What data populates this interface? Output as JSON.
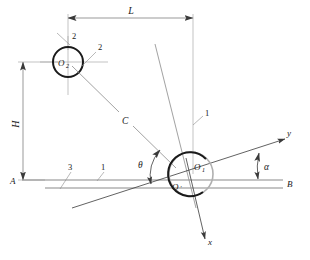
{
  "figure": {
    "type": "engineering-line-diagram",
    "background_color": "#ffffff",
    "line_color": "#6e6e6e",
    "heavy_line_color": "#1a1a1a",
    "text_color": "#1a1a1a"
  },
  "labels": {
    "dimension_L": "L",
    "dimension_H": "H",
    "circle_small_center": "O",
    "circle_small_center_sub": "2",
    "circle_large_center": "O",
    "circle_large_center_sub": "1",
    "point_o_prime": "O",
    "point_o_prime_mark": "′",
    "line_C": "C",
    "angle_theta": "θ",
    "angle_alpha": "α",
    "axis_x": "x",
    "axis_y": "y",
    "point_A": "A",
    "point_B": "B",
    "callout_2_upper": "2",
    "callout_2_right": "2",
    "callout_3": "3",
    "callout_1_left": "1",
    "callout_1_right": "1"
  },
  "geometry": {
    "small_circle": {
      "cx": 68,
      "cy": 62,
      "r": 15
    },
    "large_circle": {
      "cx": 191,
      "cy": 174,
      "r": 22
    },
    "baseline_A_y": 180,
    "baseline_lower_y": 188,
    "dimension_L_y": 18,
    "dimension_L_x1": 68,
    "dimension_L_x2": 193,
    "dimension_H_x": 23,
    "dimension_H_y1": 62,
    "dimension_H_y2": 180,
    "x_axis_end": {
      "x": 206,
      "y": 240
    },
    "y_axis_end": {
      "x": 287,
      "y": 138
    },
    "alpha_degrees": 13,
    "theta_degrees": 63
  }
}
